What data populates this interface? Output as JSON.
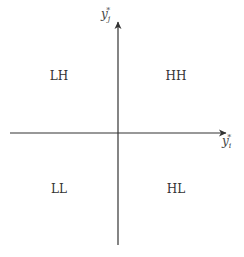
{
  "diagram": {
    "axes": {
      "x_label": {
        "base": "y",
        "sub": "i",
        "sup": "*"
      },
      "y_label": {
        "base": "y",
        "sub": "j",
        "sup": "*"
      },
      "color": "#333333"
    },
    "quadrants": {
      "top_left": "LH",
      "top_right": "HH",
      "bottom_left": "LL",
      "bottom_right": "HL"
    }
  }
}
